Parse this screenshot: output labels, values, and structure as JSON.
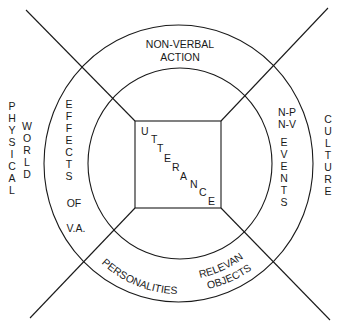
{
  "diagram": {
    "center": {
      "label": "UTTERANCE",
      "letters": [
        "U",
        "T",
        "T",
        "E",
        "R",
        "A",
        "N",
        "C",
        "E"
      ]
    },
    "inner_ring": {
      "top": [
        "NON-VERBAL",
        "ACTION"
      ],
      "left_word1": [
        "E",
        "F",
        "F",
        "E",
        "C",
        "T",
        "S"
      ],
      "left_word2": "OF",
      "left_word3": "V.A.",
      "right_header1": "N-P",
      "right_header2": "N-V",
      "right_word": [
        "E",
        "V",
        "E",
        "N",
        "T",
        "S"
      ],
      "bottom_left": "PERSONALITIES",
      "bottom_right1": "RELEVANT",
      "bottom_right2": "OBJECTS"
    },
    "outer": {
      "left_word1": [
        "P",
        "H",
        "Y",
        "S",
        "I",
        "C",
        "A",
        "L"
      ],
      "left_word2": [
        "W",
        "O",
        "R",
        "L",
        "D"
      ],
      "right_word": [
        "C",
        "U",
        "L",
        "T",
        "U",
        "R",
        "E"
      ]
    },
    "colors": {
      "ink": "#1a1a1a",
      "background": "#ffffff"
    }
  }
}
